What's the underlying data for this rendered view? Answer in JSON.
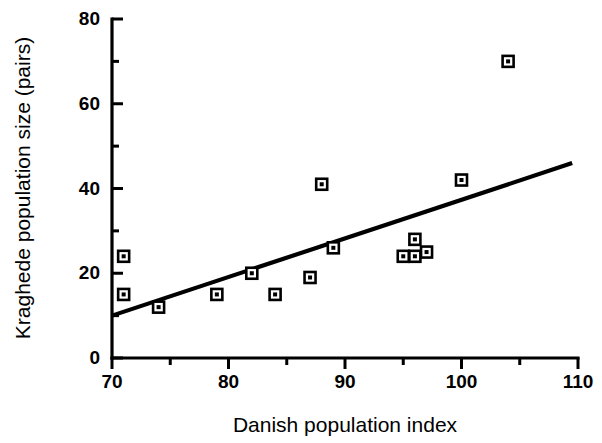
{
  "chart_data": {
    "type": "scatter",
    "title": "",
    "xlabel": "Danish population index",
    "ylabel": "Kraghede population size (pairs)",
    "xlim": [
      70,
      110
    ],
    "ylim": [
      0,
      80
    ],
    "x_ticks_major": [
      70,
      80,
      90,
      100,
      110
    ],
    "x_ticks_minor": [
      75,
      85,
      95,
      105
    ],
    "y_ticks_major": [
      0,
      20,
      40,
      60,
      80
    ],
    "y_ticks_minor": [
      10,
      30,
      50,
      70
    ],
    "grid": false,
    "legend": "none",
    "points": [
      {
        "x": 71,
        "y": 24
      },
      {
        "x": 71,
        "y": 15
      },
      {
        "x": 74,
        "y": 12
      },
      {
        "x": 79,
        "y": 15
      },
      {
        "x": 82,
        "y": 20
      },
      {
        "x": 84,
        "y": 15
      },
      {
        "x": 87,
        "y": 19
      },
      {
        "x": 88,
        "y": 41
      },
      {
        "x": 89,
        "y": 26
      },
      {
        "x": 95,
        "y": 24
      },
      {
        "x": 96,
        "y": 28
      },
      {
        "x": 96,
        "y": 24
      },
      {
        "x": 97,
        "y": 25
      },
      {
        "x": 100,
        "y": 42
      },
      {
        "x": 104,
        "y": 70
      }
    ],
    "fit_line": {
      "x_start": 70,
      "y_start": 10,
      "x_end": 109.5,
      "y_end": 46
    },
    "marker_style": "open-square-with-dot",
    "colors": {
      "axis": "#000000",
      "marker": "#000000",
      "fit_line": "#000000",
      "background": "#ffffff"
    }
  },
  "axis": {
    "y_tick_labels": [
      "0",
      "20",
      "40",
      "60",
      "80"
    ],
    "x_tick_labels": [
      "70",
      "80",
      "90",
      "100",
      "110"
    ],
    "x_title": "Danish population index",
    "y_title": "Kraghede population size (pairs)"
  }
}
